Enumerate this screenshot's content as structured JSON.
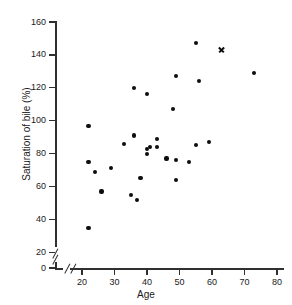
{
  "chart_data": {
    "type": "scatter",
    "title": "",
    "xlabel": "Age",
    "ylabel": "Saturation of bile (%)",
    "xlim": [
      17,
      84
    ],
    "ylim": [
      0,
      165
    ],
    "grid": false,
    "legend": "none",
    "axis_breaks": {
      "x": "break between 0 and 20",
      "y": "break between 0 and 20"
    },
    "xticks": [
      20,
      30,
      40,
      50,
      60,
      70,
      80
    ],
    "xtick_labels": [
      "20",
      "30",
      "40",
      "50",
      "60",
      "70",
      "80"
    ],
    "yticks": [
      0,
      20,
      40,
      60,
      80,
      100,
      120,
      140,
      160
    ],
    "ytick_labels": [
      "0",
      "20",
      "40",
      "60",
      "80",
      "100",
      "120",
      "140",
      "160"
    ],
    "series": [
      {
        "name": "patients",
        "marker": "filled-circle",
        "color": "#0d0d0d",
        "points": [
          [
            22,
            97
          ],
          [
            22,
            35
          ],
          [
            22,
            75
          ],
          [
            24,
            69
          ],
          [
            26,
            57
          ],
          [
            29,
            71
          ],
          [
            33,
            86
          ],
          [
            35,
            55
          ],
          [
            36,
            91
          ],
          [
            36,
            120
          ],
          [
            37,
            52
          ],
          [
            38,
            65
          ],
          [
            40,
            116
          ],
          [
            40,
            80
          ],
          [
            40,
            83
          ],
          [
            41,
            84
          ],
          [
            43,
            89
          ],
          [
            43,
            84
          ],
          [
            46,
            77
          ],
          [
            48,
            107
          ],
          [
            49,
            127
          ],
          [
            49,
            76
          ],
          [
            49,
            64
          ],
          [
            53,
            75
          ],
          [
            55,
            147
          ],
          [
            55,
            85
          ],
          [
            56,
            124
          ],
          [
            59,
            87
          ],
          [
            73,
            129
          ]
        ]
      },
      {
        "name": "outlier",
        "marker": "cross",
        "color": "#0d0d0d",
        "points": [
          [
            63,
            143
          ]
        ]
      }
    ]
  }
}
